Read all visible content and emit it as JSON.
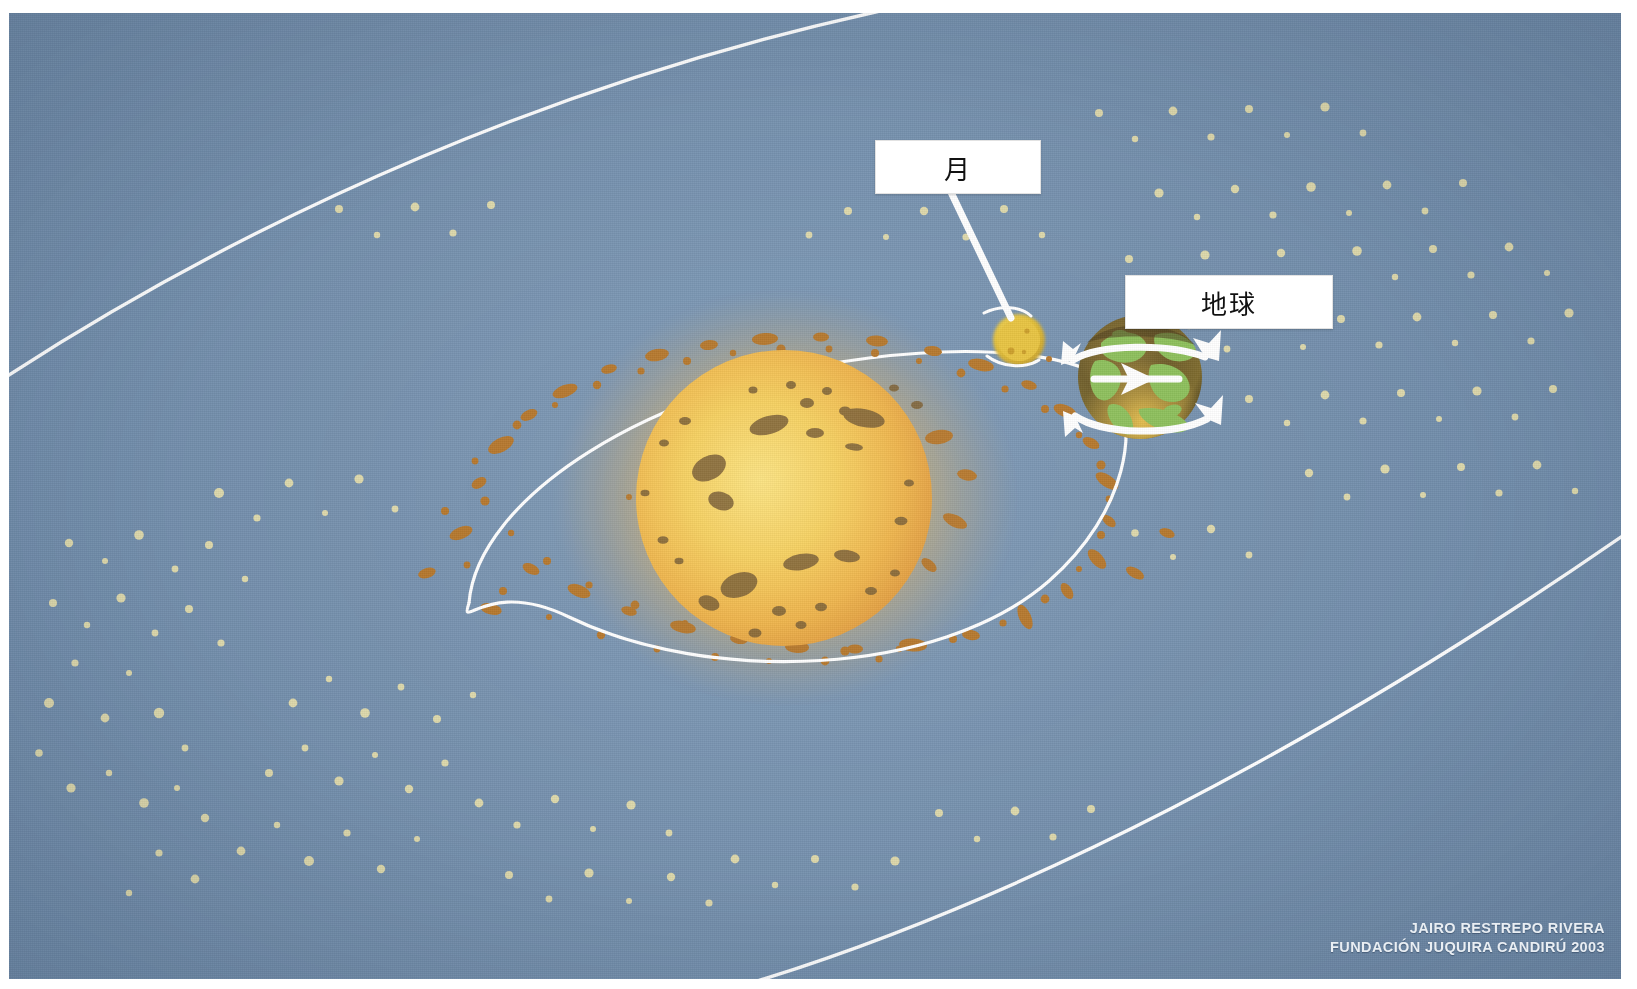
{
  "figure": {
    "title_cutoff": "",
    "type": "astronomy-diagram",
    "scene": "solar-system-sun-earth-moon-asteroid-belt",
    "background_color": "#7590ad",
    "orbit_line_color": "#ffffff"
  },
  "labels": {
    "moon": {
      "text": "月",
      "meaning": "Moon"
    },
    "earth": {
      "text": "地球",
      "meaning": "Earth"
    }
  },
  "bodies": {
    "sun": {
      "name": "sun",
      "color": "#f0c44a",
      "rim_color": "#e09a3c",
      "glow_color": "#e3b35e",
      "spot_color": "#7d6033"
    },
    "earth": {
      "name": "earth",
      "land_color": "#8cbf5a",
      "ocean_color": "#6b5a2a",
      "shade_color": "#4b3d1c",
      "highlight_color": "#e8c04e"
    },
    "moon": {
      "name": "moon",
      "color": "#e8c33f",
      "edge_color": "#c79c2a"
    }
  },
  "belt": {
    "asteroid_color": "#b5762a",
    "dust_color": "#ddd8ab"
  },
  "credit": {
    "line1": "JAIRO RESTREPO RIVERA",
    "line2": "FUNDACIÓN JUQUIRA CANDIRÚ 2003"
  }
}
